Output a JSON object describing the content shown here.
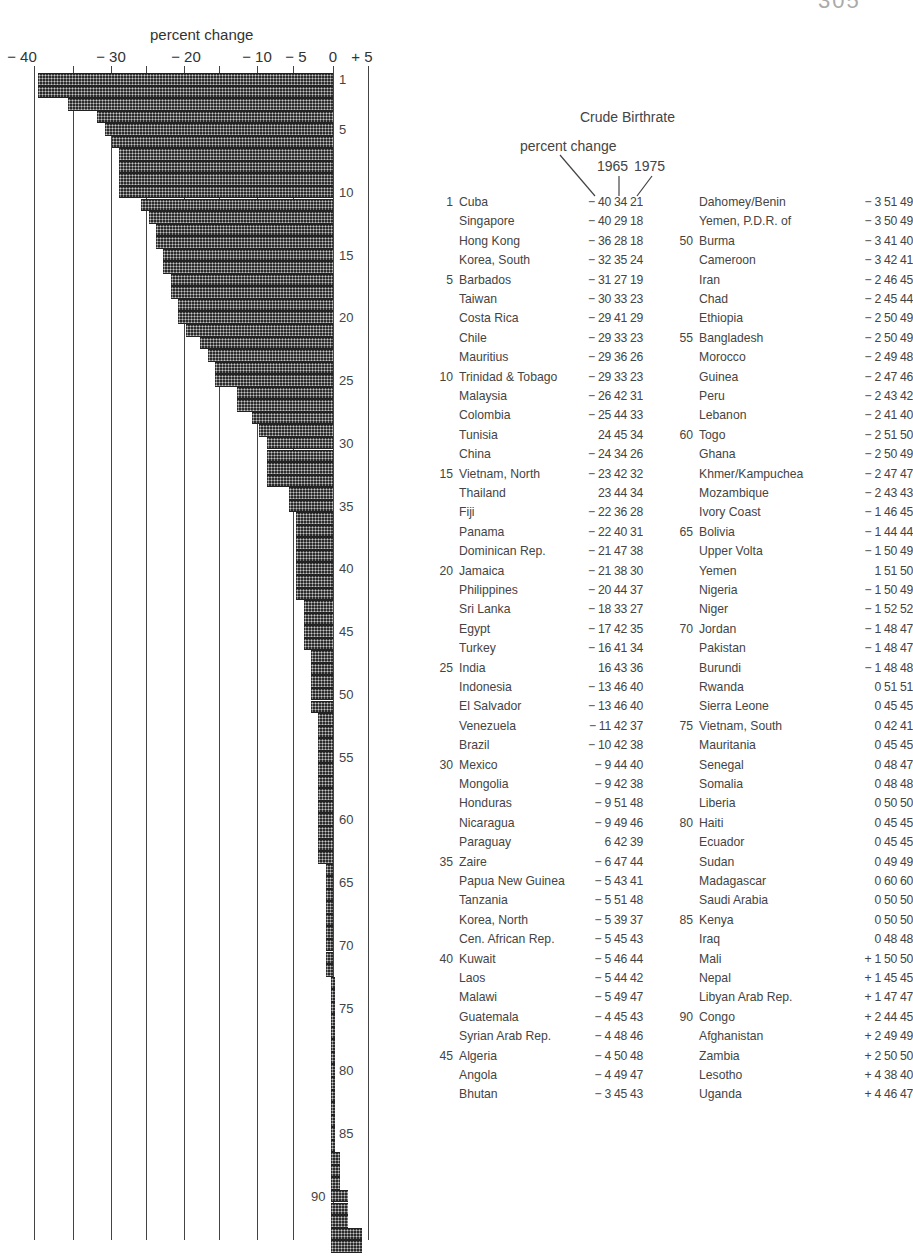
{
  "page_corner": "305",
  "chart_data": {
    "type": "bar",
    "orientation": "horizontal",
    "title": "Crude Birthrate",
    "xlabel": "percent change",
    "ylabel": "",
    "xlim": [
      -40,
      5
    ],
    "x_ticks": [
      "-40",
      "-30",
      "-20",
      "-10",
      "-5",
      "0",
      "+5"
    ],
    "grid": true,
    "row_tick_labels": [
      "1",
      "5",
      "10",
      "15",
      "20",
      "25",
      "30",
      "35",
      "40",
      "45",
      "50",
      "55",
      "60",
      "65",
      "70",
      "75",
      "80",
      "85",
      "90"
    ],
    "categories": [
      "Cuba",
      "Singapore",
      "Hong Kong",
      "Korea, South",
      "Barbados",
      "Taiwan",
      "Costa Rica",
      "Chile",
      "Mauritius",
      "Trinidad & Tobago",
      "Malaysia",
      "Colombia",
      "Tunisia",
      "China",
      "Vietnam, North",
      "Thailand",
      "Fiji",
      "Panama",
      "Dominican Rep.",
      "Jamaica",
      "Philippines",
      "Sri Lanka",
      "Egypt",
      "Turkey",
      "India",
      "Indonesia",
      "El Salvador",
      "Venezuela",
      "Brazil",
      "Mexico",
      "Mongolia",
      "Honduras",
      "Nicaragua",
      "Paraguay",
      "Zaire",
      "Papua New Guinea",
      "Tanzania",
      "Korea, North",
      "Cen. African Rep.",
      "Kuwait",
      "Laos",
      "Malawi",
      "Guatemala",
      "Syrian Arab Rep.",
      "Algeria",
      "Angola",
      "Bhutan",
      "Dahomey/Benin",
      "Yemen, P.D.R. of",
      "Burma",
      "Cameroon",
      "Iran",
      "Chad",
      "Ethiopia",
      "Bangladesh",
      "Morocco",
      "Guinea",
      "Peru",
      "Lebanon",
      "Togo",
      "Ghana",
      "Khmer/Kampuchea",
      "Mozambique",
      "Ivory Coast",
      "Bolivia",
      "Upper Volta",
      "Yemen",
      "Nigeria",
      "Niger",
      "Jordan",
      "Pakistan",
      "Burundi",
      "Rwanda",
      "Sierra Leone",
      "Vietnam, South",
      "Mauritania",
      "Senegal",
      "Somalia",
      "Liberia",
      "Haiti",
      "Ecuador",
      "Sudan",
      "Madagascar",
      "Saudi Arabia",
      "Kenya",
      "Iraq",
      "Mali",
      "Nepal",
      "Libyan Arab Rep.",
      "Congo",
      "Afghanistan",
      "Zambia",
      "Lesotho",
      "Uganda"
    ],
    "series": [
      {
        "name": "percent change",
        "values": [
          -40,
          -40,
          -36,
          -32,
          -31,
          -30,
          -29,
          -29,
          -29,
          -29,
          -26,
          -25,
          -24,
          -24,
          -23,
          -23,
          -22,
          -22,
          -21,
          -21,
          -20,
          -18,
          -17,
          -16,
          -16,
          -13,
          -13,
          -11,
          -10,
          -9,
          -9,
          -9,
          -9,
          -6,
          -6,
          -5,
          -5,
          -5,
          -5,
          -5,
          -5,
          -5,
          -4,
          -4,
          -4,
          -4,
          -3,
          -3,
          -3,
          -3,
          -3,
          -2,
          -2,
          -2,
          -2,
          -2,
          -2,
          -2,
          -2,
          -2,
          -2,
          -2,
          -2,
          -1,
          -1,
          -1,
          -1,
          -1,
          -1,
          -1,
          -1,
          -1,
          0,
          0,
          0,
          0,
          0,
          0,
          0,
          0,
          0,
          0,
          0,
          0,
          0,
          0,
          1,
          1,
          1,
          2,
          2,
          2,
          4,
          4
        ]
      },
      {
        "name": "1965",
        "values": [
          34,
          29,
          28,
          35,
          27,
          33,
          41,
          33,
          36,
          33,
          42,
          44,
          45,
          34,
          42,
          44,
          36,
          40,
          47,
          38,
          44,
          33,
          42,
          41,
          43,
          46,
          46,
          42,
          42,
          44,
          42,
          51,
          49,
          42,
          47,
          43,
          51,
          39,
          45,
          46,
          44,
          49,
          45,
          48,
          50,
          49,
          45,
          51,
          50,
          41,
          42,
          46,
          45,
          50,
          50,
          49,
          47,
          43,
          41,
          51,
          50,
          47,
          43,
          46,
          44,
          50,
          51,
          50,
          52,
          48,
          48,
          48,
          51,
          45,
          42,
          45,
          48,
          48,
          50,
          45,
          45,
          49,
          60,
          50,
          50,
          48,
          50,
          45,
          47,
          44,
          49,
          50,
          38,
          46
        ]
      },
      {
        "name": "1975",
        "values": [
          21,
          18,
          18,
          24,
          19,
          23,
          29,
          23,
          26,
          23,
          31,
          33,
          34,
          26,
          32,
          34,
          28,
          31,
          38,
          30,
          37,
          27,
          35,
          34,
          36,
          40,
          40,
          37,
          38,
          40,
          38,
          48,
          46,
          39,
          44,
          41,
          48,
          37,
          43,
          44,
          42,
          47,
          43,
          46,
          48,
          47,
          43,
          49,
          49,
          40,
          41,
          45,
          44,
          49,
          49,
          48,
          46,
          42,
          40,
          50,
          49,
          47,
          43,
          45,
          44,
          49,
          50,
          49,
          52,
          47,
          47,
          48,
          51,
          45,
          41,
          45,
          47,
          48,
          50,
          45,
          45,
          49,
          60,
          50,
          50,
          48,
          50,
          45,
          47,
          45,
          49,
          50,
          40,
          47
        ]
      }
    ]
  },
  "chart": {
    "axis_title": "percent change",
    "ticks": [
      {
        "label": "− 40",
        "x": 22
      },
      {
        "label": "− 30",
        "x": 111
      },
      {
        "label": "− 20",
        "x": 186
      },
      {
        "label": "− 10",
        "x": 257
      },
      {
        "label": "− 5",
        "x": 296
      },
      {
        "label": "0",
        "x": 333
      },
      {
        "label": "+ 5",
        "x": 362
      }
    ]
  },
  "table": {
    "title": "Crude Birthrate",
    "header_percent": "percent change",
    "header_1965": "1965",
    "header_1975": "1975",
    "left": [
      {
        "rank": "1",
        "name": "Cuba",
        "vals": "− 40 34 21"
      },
      {
        "rank": "",
        "name": "Singapore",
        "vals": "− 40 29 18"
      },
      {
        "rank": "",
        "name": "Hong Kong",
        "vals": "− 36 28 18"
      },
      {
        "rank": "",
        "name": "Korea, South",
        "vals": "− 32 35 24"
      },
      {
        "rank": "5",
        "name": "Barbados",
        "vals": "− 31 27 19"
      },
      {
        "rank": "",
        "name": "Taiwan",
        "vals": "− 30 33 23"
      },
      {
        "rank": "",
        "name": "Costa Rica",
        "vals": "− 29 41 29"
      },
      {
        "rank": "",
        "name": "Chile",
        "vals": "− 29 33 23"
      },
      {
        "rank": "",
        "name": "Mauritius",
        "vals": "− 29 36 26"
      },
      {
        "rank": "10",
        "name": "Trinidad & Tobago",
        "vals": "− 29 33 23"
      },
      {
        "rank": "",
        "name": "Malaysia",
        "vals": "− 26 42 31"
      },
      {
        "rank": "",
        "name": "Colombia",
        "vals": "− 25 44 33"
      },
      {
        "rank": "",
        "name": "Tunisia",
        "vals": "24 45 34"
      },
      {
        "rank": "",
        "name": "China",
        "vals": "− 24 34 26"
      },
      {
        "rank": "15",
        "name": "Vietnam, North",
        "vals": "− 23 42 32"
      },
      {
        "rank": "",
        "name": "Thailand",
        "vals": "23 44 34"
      },
      {
        "rank": "",
        "name": "Fiji",
        "vals": "− 22 36 28"
      },
      {
        "rank": "",
        "name": "Panama",
        "vals": "− 22 40 31"
      },
      {
        "rank": "",
        "name": "Dominican Rep.",
        "vals": "− 21 47 38"
      },
      {
        "rank": "20",
        "name": "Jamaica",
        "vals": "− 21 38 30"
      },
      {
        "rank": "",
        "name": "Philippines",
        "vals": "− 20 44 37"
      },
      {
        "rank": "",
        "name": "Sri Lanka",
        "vals": "− 18 33 27"
      },
      {
        "rank": "",
        "name": "Egypt",
        "vals": "− 17 42 35"
      },
      {
        "rank": "",
        "name": "Turkey",
        "vals": "− 16 41 34"
      },
      {
        "rank": "25",
        "name": "India",
        "vals": "16 43 36"
      },
      {
        "rank": "",
        "name": "Indonesia",
        "vals": "− 13 46 40"
      },
      {
        "rank": "",
        "name": "El Salvador",
        "vals": "− 13 46 40"
      },
      {
        "rank": "",
        "name": "Venezuela",
        "vals": "− 11 42 37"
      },
      {
        "rank": "",
        "name": "Brazil",
        "vals": "− 10 42 38"
      },
      {
        "rank": "30",
        "name": "Mexico",
        "vals": "− 9 44 40"
      },
      {
        "rank": "",
        "name": "Mongolia",
        "vals": "− 9 42 38"
      },
      {
        "rank": "",
        "name": "Honduras",
        "vals": "− 9 51 48"
      },
      {
        "rank": "",
        "name": "Nicaragua",
        "vals": "− 9 49 46"
      },
      {
        "rank": "",
        "name": "Paraguay",
        "vals": "6 42 39"
      },
      {
        "rank": "35",
        "name": "Zaire",
        "vals": "− 6 47 44"
      },
      {
        "rank": "",
        "name": "Papua New Guinea",
        "vals": "− 5 43 41"
      },
      {
        "rank": "",
        "name": "Tanzania",
        "vals": "− 5 51 48"
      },
      {
        "rank": "",
        "name": "Korea, North",
        "vals": "− 5 39 37"
      },
      {
        "rank": "",
        "name": "Cen. African Rep.",
        "vals": "− 5 45 43"
      },
      {
        "rank": "40",
        "name": "Kuwait",
        "vals": "− 5 46 44"
      },
      {
        "rank": "",
        "name": "Laos",
        "vals": "− 5 44 42"
      },
      {
        "rank": "",
        "name": "Malawi",
        "vals": "− 5 49 47"
      },
      {
        "rank": "",
        "name": "Guatemala",
        "vals": "− 4 45 43"
      },
      {
        "rank": "",
        "name": "Syrian Arab Rep.",
        "vals": "− 4 48 46"
      },
      {
        "rank": "45",
        "name": "Algeria",
        "vals": "− 4 50 48"
      },
      {
        "rank": "",
        "name": "Angola",
        "vals": "− 4 49 47"
      },
      {
        "rank": "",
        "name": "Bhutan",
        "vals": "− 3 45 43"
      }
    ],
    "right": [
      {
        "rank": "",
        "name": "Dahomey/Benin",
        "vals": "− 3 51 49"
      },
      {
        "rank": "",
        "name": "Yemen, P.D.R. of",
        "vals": "− 3 50 49"
      },
      {
        "rank": "50",
        "name": "Burma",
        "vals": "− 3 41 40"
      },
      {
        "rank": "",
        "name": "Cameroon",
        "vals": "− 3 42 41"
      },
      {
        "rank": "",
        "name": "Iran",
        "vals": "− 2 46 45"
      },
      {
        "rank": "",
        "name": "Chad",
        "vals": "− 2 45 44"
      },
      {
        "rank": "",
        "name": "Ethiopia",
        "vals": "− 2 50 49"
      },
      {
        "rank": "55",
        "name": "Bangladesh",
        "vals": "− 2 50 49"
      },
      {
        "rank": "",
        "name": "Morocco",
        "vals": "− 2 49 48"
      },
      {
        "rank": "",
        "name": "Guinea",
        "vals": "− 2 47 46"
      },
      {
        "rank": "",
        "name": "Peru",
        "vals": "− 2 43 42"
      },
      {
        "rank": "",
        "name": "Lebanon",
        "vals": "− 2 41 40"
      },
      {
        "rank": "60",
        "name": "Togo",
        "vals": "− 2 51 50"
      },
      {
        "rank": "",
        "name": "Ghana",
        "vals": "− 2 50 49"
      },
      {
        "rank": "",
        "name": "Khmer/Kampuchea",
        "vals": "− 2 47 47"
      },
      {
        "rank": "",
        "name": "Mozambique",
        "vals": "− 2 43 43"
      },
      {
        "rank": "",
        "name": "Ivory Coast",
        "vals": "− 1 46 45"
      },
      {
        "rank": "65",
        "name": "Bolivia",
        "vals": "− 1 44 44"
      },
      {
        "rank": "",
        "name": "Upper Volta",
        "vals": "− 1 50 49"
      },
      {
        "rank": "",
        "name": "Yemen",
        "vals": "1 51 50"
      },
      {
        "rank": "",
        "name": "Nigeria",
        "vals": "− 1 50 49"
      },
      {
        "rank": "",
        "name": "Niger",
        "vals": "− 1 52 52"
      },
      {
        "rank": "70",
        "name": "Jordan",
        "vals": "− 1 48 47"
      },
      {
        "rank": "",
        "name": "Pakistan",
        "vals": "− 1 48 47"
      },
      {
        "rank": "",
        "name": "Burundi",
        "vals": "− 1 48 48"
      },
      {
        "rank": "",
        "name": "Rwanda",
        "vals": "0 51 51"
      },
      {
        "rank": "",
        "name": "Sierra Leone",
        "vals": "0 45 45"
      },
      {
        "rank": "75",
        "name": "Vietnam, South",
        "vals": "0 42 41"
      },
      {
        "rank": "",
        "name": "Mauritania",
        "vals": "0 45 45"
      },
      {
        "rank": "",
        "name": "Senegal",
        "vals": "0 48 47"
      },
      {
        "rank": "",
        "name": "Somalia",
        "vals": "0 48 48"
      },
      {
        "rank": "",
        "name": "Liberia",
        "vals": "0 50 50"
      },
      {
        "rank": "80",
        "name": "Haiti",
        "vals": "0 45 45"
      },
      {
        "rank": "",
        "name": "Ecuador",
        "vals": "0 45 45"
      },
      {
        "rank": "",
        "name": "Sudan",
        "vals": "0 49 49"
      },
      {
        "rank": "",
        "name": "Madagascar",
        "vals": "0 60 60"
      },
      {
        "rank": "",
        "name": "Saudi Arabia",
        "vals": "0 50 50"
      },
      {
        "rank": "85",
        "name": "Kenya",
        "vals": "0 50 50"
      },
      {
        "rank": "",
        "name": "Iraq",
        "vals": "0 48 48"
      },
      {
        "rank": "",
        "name": "Mali",
        "vals": "+ 1 50 50"
      },
      {
        "rank": "",
        "name": "Nepal",
        "vals": "+ 1 45 45"
      },
      {
        "rank": "",
        "name": "Libyan Arab Rep.",
        "vals": "+ 1 47 47"
      },
      {
        "rank": "90",
        "name": "Congo",
        "vals": "+ 2 44 45"
      },
      {
        "rank": "",
        "name": "Afghanistan",
        "vals": "+ 2 49 49"
      },
      {
        "rank": "",
        "name": "Zambia",
        "vals": "+ 2 50 50"
      },
      {
        "rank": "",
        "name": "Lesotho",
        "vals": "+ 4 38 40"
      },
      {
        "rank": "",
        "name": "Uganda",
        "vals": "+ 4 46 47"
      }
    ]
  }
}
